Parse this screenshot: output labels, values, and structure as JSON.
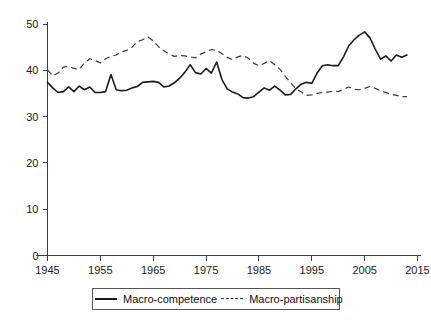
{
  "chart_data": {
    "type": "line",
    "title": "",
    "xlabel": "",
    "ylabel": "",
    "xlim": [
      1945,
      2015
    ],
    "ylim": [
      0,
      50
    ],
    "grid": false,
    "legend_position": "bottom",
    "xticks": [
      1945,
      1955,
      1965,
      1975,
      1985,
      1995,
      2005,
      2015
    ],
    "yticks": [
      0,
      10,
      20,
      30,
      40,
      50
    ],
    "x": [
      1945,
      1946,
      1947,
      1948,
      1949,
      1950,
      1951,
      1952,
      1953,
      1954,
      1955,
      1956,
      1957,
      1958,
      1959,
      1960,
      1961,
      1962,
      1963,
      1964,
      1965,
      1966,
      1967,
      1968,
      1969,
      1970,
      1971,
      1972,
      1973,
      1974,
      1975,
      1976,
      1977,
      1978,
      1979,
      1980,
      1981,
      1982,
      1983,
      1984,
      1985,
      1986,
      1987,
      1988,
      1989,
      1990,
      1991,
      1992,
      1993,
      1994,
      1995,
      1996,
      1997,
      1998,
      1999,
      2000,
      2001,
      2002,
      2003,
      2004,
      2005,
      2006,
      2007,
      2008,
      2009,
      2010,
      2011,
      2012,
      2013
    ],
    "series": [
      {
        "name": "Macro-competence",
        "style": "solid",
        "color": "#1b1b1b",
        "values": [
          37.4,
          36.2,
          35.2,
          35.4,
          36.4,
          35.4,
          36.6,
          35.8,
          36.4,
          35.2,
          35.2,
          35.4,
          39.1,
          35.8,
          35.6,
          35.7,
          36.2,
          36.5,
          37.4,
          37.5,
          37.6,
          37.4,
          36.4,
          36.6,
          37.3,
          38.3,
          39.6,
          41.2,
          39.5,
          39.2,
          40.4,
          39.4,
          41.8,
          38.0,
          36.0,
          35.3,
          34.9,
          34.1,
          34.0,
          34.3,
          35.3,
          36.2,
          35.7,
          36.6,
          35.7,
          34.7,
          34.8,
          36.0,
          37.0,
          37.4,
          37.2,
          39.4,
          41.0,
          41.2,
          41.0,
          41.0,
          42.9,
          45.3,
          46.6,
          47.6,
          48.3,
          47.0,
          44.6,
          42.4,
          43.1,
          42.0,
          43.3,
          42.8,
          43.3
        ]
      },
      {
        "name": "Macro-partisanship",
        "style": "dashed",
        "color": "#3a3a3a",
        "values": [
          40.1,
          38.8,
          39.4,
          40.7,
          40.9,
          40.4,
          40.2,
          41.6,
          42.5,
          42.1,
          41.6,
          42.5,
          43.0,
          43.3,
          44.0,
          44.3,
          45.0,
          46.2,
          46.6,
          47.2,
          46.4,
          45.1,
          44.2,
          43.5,
          43.0,
          43.2,
          43.1,
          42.9,
          42.7,
          43.5,
          44.0,
          44.5,
          44.3,
          43.6,
          42.8,
          42.3,
          42.9,
          43.2,
          42.6,
          41.5,
          41.0,
          41.5,
          42.1,
          41.2,
          40.2,
          38.7,
          37.3,
          36.0,
          35.3,
          34.6,
          34.7,
          35.0,
          35.2,
          35.3,
          35.5,
          35.4,
          35.9,
          36.4,
          35.9,
          35.8,
          36.1,
          36.5,
          36.1,
          35.6,
          35.2,
          34.8,
          34.6,
          34.3,
          34.3
        ]
      }
    ]
  },
  "legend": {
    "entries": [
      {
        "label": "Macro-competence",
        "swatch": "solid-line-swatch"
      },
      {
        "label": "Macro-partisanship",
        "swatch": "dashed-line-swatch"
      }
    ]
  }
}
